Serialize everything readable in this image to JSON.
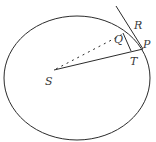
{
  "diagram": {
    "type": "orbital geometry (Kepler/Newton ellipse)",
    "colors": {
      "stroke": "#2b2b2b",
      "label": "#3a3a3a",
      "background": "#ffffff"
    },
    "labels": {
      "S": "S",
      "Q": "Q",
      "R": "R",
      "P": "P",
      "T": "T"
    },
    "elements": [
      {
        "id": "ellipse",
        "kind": "ellipse",
        "style": "solid"
      },
      {
        "id": "SP",
        "kind": "segment",
        "from": "S",
        "to": "P",
        "style": "solid"
      },
      {
        "id": "SQ",
        "kind": "segment",
        "from": "S",
        "to": "Q",
        "style": "dashed"
      },
      {
        "id": "QT",
        "kind": "segment",
        "from": "Q",
        "to": "T",
        "style": "solid"
      },
      {
        "id": "tangent",
        "kind": "line",
        "through": [
          "R",
          "P"
        ],
        "style": "solid"
      }
    ]
  }
}
